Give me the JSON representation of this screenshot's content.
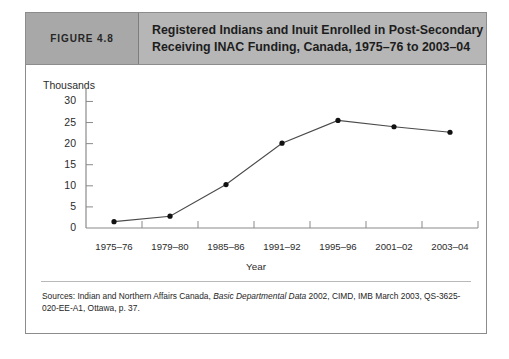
{
  "figure": {
    "number_label": "FIGURE 4.8",
    "title_line1": "Registered Indians and Inuit Enrolled in Post-Secondary",
    "title_line2": "Receiving INAC Funding, Canada, 1975–76 to 2003–04",
    "header_bg": "#b6b6b6",
    "number_bg": "#a8a8a8",
    "border_color": "#8c8c8c"
  },
  "source": {
    "prefix": "Sources: Indian and Northern Affairs Canada, ",
    "italic_title": "Basic Departmental Data",
    "suffix": " 2002, CIMD, IMB March 2003, QS-3625-020-EE-A1, Ottawa, p. 37."
  },
  "chart_data": {
    "type": "line",
    "title": "Registered Indians and Inuit Enrolled in Post-Secondary Receiving INAC Funding, Canada, 1975–76 to 2003–04",
    "unit_label": "Thousands",
    "xlabel": "Year",
    "ylabel": "",
    "categories": [
      "1975–76",
      "1979–80",
      "1985–86",
      "1991–92",
      "1995–96",
      "2001–02",
      "2003–04"
    ],
    "values": [
      1.5,
      2.8,
      10.3,
      20.1,
      25.5,
      24.0,
      22.7
    ],
    "yticks": [
      0,
      5,
      10,
      15,
      20,
      25,
      30
    ],
    "ylim": [
      0,
      32
    ],
    "grid": false,
    "legend": null,
    "line_color": "#4a4a4a",
    "marker_color": "#111111",
    "axis_color": "#8a8a8a"
  }
}
